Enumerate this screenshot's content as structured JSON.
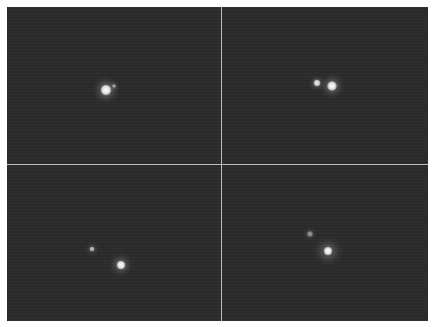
{
  "image": {
    "description": "2x2 grid of dark astronomical frames showing bright point sources (binary star pairs)",
    "background_color": "#2b2b2b",
    "divider_color": "#bdbdbd",
    "margin_color": "#ffffff"
  },
  "panels": [
    {
      "id": "top-left",
      "stars": [
        {
          "x": 106,
          "y": 90,
          "size": 11,
          "glow": 7,
          "brightness": 1.0
        },
        {
          "x": 114,
          "y": 86,
          "size": 4,
          "glow": 3,
          "brightness": 0.55
        }
      ]
    },
    {
      "id": "top-right",
      "stars": [
        {
          "x": 317,
          "y": 83,
          "size": 7,
          "glow": 4,
          "brightness": 0.9
        },
        {
          "x": 332,
          "y": 86,
          "size": 10,
          "glow": 6,
          "brightness": 1.0
        }
      ]
    },
    {
      "id": "bottom-left",
      "stars": [
        {
          "x": 92,
          "y": 249,
          "size": 5,
          "glow": 4,
          "brightness": 0.7
        },
        {
          "x": 121,
          "y": 265,
          "size": 9,
          "glow": 6,
          "brightness": 1.0
        }
      ]
    },
    {
      "id": "bottom-right",
      "stars": [
        {
          "x": 310,
          "y": 234,
          "size": 6,
          "glow": 4,
          "brightness": 0.5
        },
        {
          "x": 328,
          "y": 251,
          "size": 9,
          "glow": 9,
          "brightness": 1.0
        }
      ]
    }
  ]
}
